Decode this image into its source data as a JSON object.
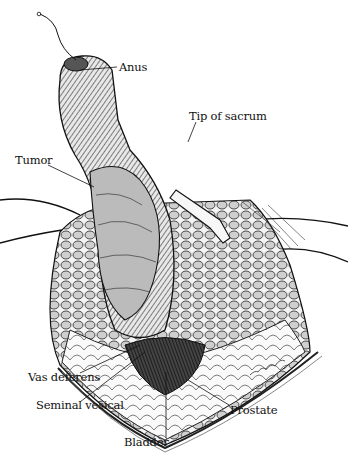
{
  "figure": {
    "labels": {
      "anus": "Anus",
      "tip_of_sacrum": "Tip of sacrum",
      "tumor": "Tumor",
      "vas_deferens": "Vas deferens",
      "seminal_vesical": "Seminal vesical",
      "prostate": "Prostate",
      "bladder": "Bladder"
    },
    "signature": "illegible artist signature",
    "colors": {
      "ink": "#111111",
      "background": "#ffffff",
      "shade": "#555555"
    }
  }
}
